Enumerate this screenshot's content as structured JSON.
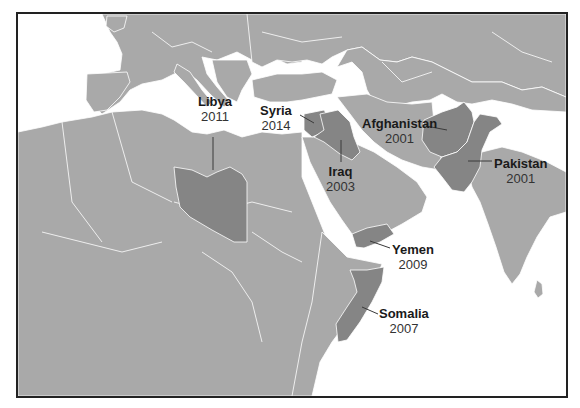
{
  "map": {
    "region": "North Africa, Middle East and South Asia",
    "colors": {
      "land": "#a9a9a9",
      "highlight": "#858585",
      "water": "#ffffff",
      "borders": "#ffffff",
      "frame": "#222222",
      "leader_line": "#3a3a3a"
    },
    "highlighted_countries": [
      {
        "name": "Libya",
        "year": "2011"
      },
      {
        "name": "Syria",
        "year": "2014"
      },
      {
        "name": "Iraq",
        "year": "2003"
      },
      {
        "name": "Afghanistan",
        "year": "2001"
      },
      {
        "name": "Pakistan",
        "year": "2001"
      },
      {
        "name": "Yemen",
        "year": "2009"
      },
      {
        "name": "Somalia",
        "year": "2007"
      }
    ]
  }
}
